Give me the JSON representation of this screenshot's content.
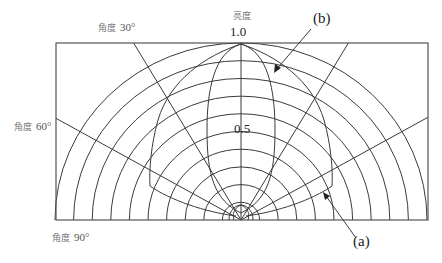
{
  "title": "亮度",
  "radial_labels": {
    "max": "1.0",
    "mid": "0.5"
  },
  "angle_labels": [
    {
      "prefix": "角度",
      "value": "30°"
    },
    {
      "prefix": "角度",
      "value": "60°"
    },
    {
      "prefix": "角度",
      "value": "90°"
    }
  ],
  "curve_labels": {
    "a": "(a)",
    "b": "(b)"
  },
  "grid": {
    "rings": 10,
    "ring_step": 0.1,
    "angle_lines_deg": [
      30,
      60
    ]
  },
  "colors": {
    "line": "#3a3a3a",
    "frame": "#555555"
  }
}
